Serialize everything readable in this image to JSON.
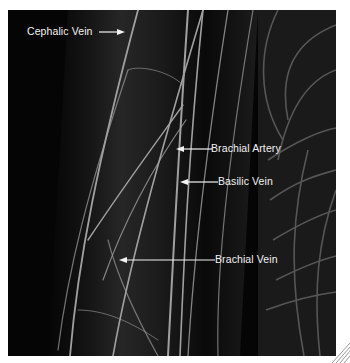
{
  "figure": {
    "background_color": "#050505",
    "vessel_color": "#9a9a9a"
  },
  "labels": [
    {
      "id": "cephalic-vein",
      "text": "Cephalic Vein",
      "arrow_direction": "right"
    },
    {
      "id": "brachial-artery",
      "text": "Brachial Artery",
      "arrow_direction": "left"
    },
    {
      "id": "basilic-vein",
      "text": "Basilic Vein",
      "arrow_direction": "left"
    },
    {
      "id": "brachial-vein",
      "text": "Brachial Vein",
      "arrow_direction": "left"
    }
  ]
}
